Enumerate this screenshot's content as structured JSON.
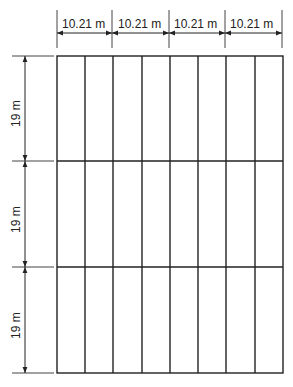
{
  "diagram": {
    "type": "layout-grid",
    "columns": 8,
    "rows": 3,
    "column_group_dimensions": [
      {
        "label": "10.21 m"
      },
      {
        "label": "10.21 m"
      },
      {
        "label": "10.21 m"
      },
      {
        "label": "10.21 m"
      }
    ],
    "row_dimensions": [
      {
        "label": "19 m"
      },
      {
        "label": "19 m"
      },
      {
        "label": "19 m"
      }
    ],
    "colors": {
      "line": "#222222",
      "background": "#ffffff"
    }
  }
}
